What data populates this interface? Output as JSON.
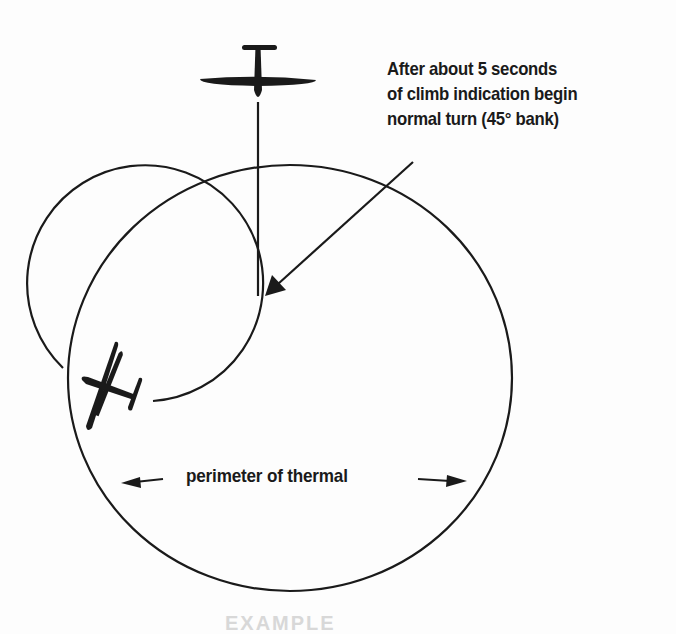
{
  "diagram": {
    "annotation": {
      "lines": [
        "After about 5 seconds",
        "of climb indication begin",
        "normal turn (45° bank)"
      ]
    },
    "perimeter_label": "perimeter of thermal",
    "caption_clipped": "EXAMPLE",
    "elements": {
      "thermal_perimeter": {
        "shape": "ellipse",
        "cx": 290,
        "cy": 378,
        "rx": 222,
        "ry": 213
      },
      "turn_path": {
        "shape": "arc",
        "cx": 143,
        "cy": 298,
        "r": 118
      },
      "entry_track": {
        "from": [
          258,
          100
        ],
        "to": [
          258,
          295
        ]
      },
      "pointer_arrow": {
        "from": [
          412,
          162
        ],
        "to": [
          266,
          295
        ]
      },
      "glider_entry": {
        "heading": "south",
        "position": [
          258,
          75
        ]
      },
      "glider_circling": {
        "heading": "north-north-east",
        "position": [
          110,
          385
        ]
      }
    },
    "colors": {
      "ink": "#1a1a1a",
      "background": "#fdfdfd"
    }
  }
}
